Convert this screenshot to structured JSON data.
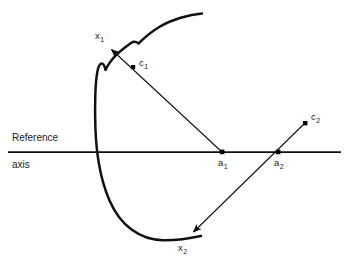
{
  "figure": {
    "type": "geometric-diagram",
    "background_color": "#ffffff",
    "stroke_color": "#000000",
    "labels": {
      "reference": "Reference",
      "axis": "axis",
      "x1": "x",
      "x1_sub": "1",
      "x2": "x",
      "x2_sub": "2",
      "c1": "c",
      "c1_sub": "1",
      "c2": "c",
      "c2_sub": "2",
      "a1": "a",
      "a1_sub": "1",
      "a2": "a",
      "a2_sub": "2"
    },
    "geometry": {
      "reference_axis": {
        "x1": 8,
        "y1": 152,
        "x2": 341,
        "y2": 152
      },
      "points": {
        "a1": {
          "x": 222,
          "y": 152
        },
        "a2": {
          "x": 278,
          "y": 152
        },
        "c1": {
          "x": 133,
          "y": 67
        },
        "c2": {
          "x": 305,
          "y": 123
        },
        "x1": {
          "x": 110,
          "y": 48
        },
        "x2": {
          "x": 192,
          "y": 233
        }
      },
      "arrows": [
        {
          "name": "a1-to-x1",
          "from": "a1",
          "to": "x1",
          "passes_through": "c1"
        },
        {
          "name": "c2-to-x2",
          "from": "c2",
          "to": "x2",
          "passes_through": "a2"
        }
      ],
      "curve_description": "open free-form contour with a concave notch near the upper-left, bulging leftward and crossing the reference axis"
    }
  }
}
